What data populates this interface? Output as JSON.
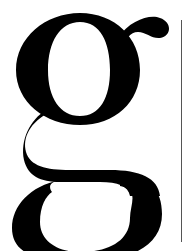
{
  "image": {
    "glyph": "g",
    "description": "Large black serif double-story lowercase letter g on white background with thin vertical rule at right",
    "colors": {
      "glyph": "#000000",
      "background": "#ffffff",
      "rule": "#555555"
    }
  }
}
